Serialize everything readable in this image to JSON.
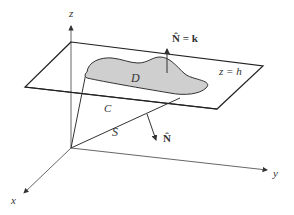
{
  "diagram": {
    "type": "3d-surface-figure",
    "axes": {
      "x_label": "x",
      "y_label": "y",
      "z_label": "z"
    },
    "plane_label": "z = h",
    "region_label": "D",
    "curve_label": "C",
    "surface_label": "S",
    "normal_top_label": "N̂ = k",
    "normal_side_label": "N̂",
    "colors": {
      "region_fill": "#cfcfcf",
      "lines": "#222222",
      "axes": "#555555",
      "background": "#ffffff"
    }
  }
}
